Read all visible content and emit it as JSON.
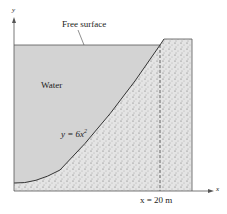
{
  "diagram": {
    "axis_y_label": "y",
    "axis_x_label": "x",
    "free_surface_label": "Free surface",
    "water_label": "Water",
    "curve_label": "y = 6x",
    "curve_exponent": "2",
    "x_marker_label": "x = 20 m",
    "colors": {
      "water": "#d3d3d3",
      "dam": "#e2e2e2",
      "line": "#333333"
    }
  }
}
